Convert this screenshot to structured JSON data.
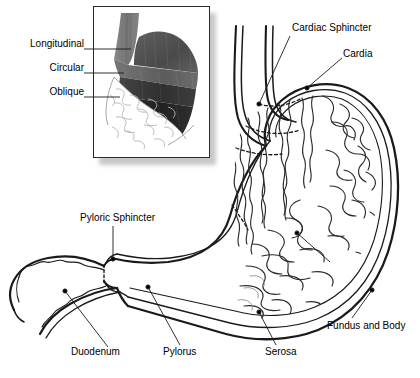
{
  "figure": {
    "width": 420,
    "height": 378,
    "background": "#ffffff",
    "line_color": "#1a1a1a",
    "text_color": "#000000"
  },
  "inset": {
    "name": "muscle-layers-inset",
    "description": "Grayscale photograph-style inset of the stomach showing three muscle layers and cut-away mucosa with rugae",
    "frame": {
      "x": 93,
      "y": 6,
      "width": 117,
      "height": 152
    },
    "colors": {
      "esophagus": "#7d7d7d",
      "longitudinal": "#6e6e6e",
      "circular": "#3c3c3c",
      "oblique": "#2a2a2a",
      "fundus_top": "#545454",
      "mucosa": "#ffffff",
      "rugae": "#b9b9b9",
      "shadow": "#9a9a9a"
    },
    "labels": [
      {
        "id": "longitudinal",
        "text": "Longitudinal",
        "x": 18,
        "y": 44,
        "leader_x1": 84,
        "leader_y1": 49,
        "leader_x2": 131,
        "leader_y2": 49
      },
      {
        "id": "circular",
        "text": "Circular",
        "x": 40,
        "y": 68,
        "leader_x1": 84,
        "leader_y1": 73,
        "leader_x2": 124,
        "leader_y2": 73
      },
      {
        "id": "oblique",
        "text": "Oblique",
        "x": 40,
        "y": 92,
        "leader_x1": 84,
        "leader_y1": 97,
        "leader_x2": 120,
        "leader_y2": 97
      }
    ]
  },
  "main_diagram": {
    "name": "stomach-cutaway",
    "description": "Line-art cut-away of stomach, esophagus and duodenum showing rugae of the mucosa",
    "labels": [
      {
        "id": "cardiac-sphincter",
        "text": "Cardiac Sphincter",
        "x": 292,
        "y": 24,
        "align": "left",
        "leader": [
          [
            290,
            36
          ],
          [
            259,
            104
          ]
        ],
        "dot": [
          259,
          104
        ]
      },
      {
        "id": "cardia",
        "text": "Cardia",
        "x": 343,
        "y": 50,
        "align": "left",
        "leader": [
          [
            342,
            58
          ],
          [
            307,
            88
          ]
        ],
        "dot": [
          307,
          88
        ]
      },
      {
        "id": "pyloric-sphincter",
        "text": "Pyloric Sphincter",
        "x": 80,
        "y": 214,
        "align": "left",
        "leader": [
          [
            113,
            226
          ],
          [
            113,
            259
          ]
        ],
        "dot": [
          113,
          259
        ]
      },
      {
        "id": "duodenum",
        "text": "Duodenum",
        "x": 71,
        "y": 349,
        "align": "left",
        "leader": [
          [
            108,
            347
          ],
          [
            65,
            291
          ]
        ],
        "dot": [
          65,
          291
        ]
      },
      {
        "id": "pylorus",
        "text": "Pylorus",
        "x": 163,
        "y": 349,
        "align": "left",
        "leader": [
          [
            180,
            345
          ],
          [
            148,
            287
          ]
        ],
        "dot": [
          148,
          287
        ]
      },
      {
        "id": "serosa",
        "text": "Serosa",
        "x": 265,
        "y": 349,
        "align": "left",
        "leader": [
          [
            276,
            345
          ],
          [
            259,
            312
          ]
        ],
        "dot": [
          259,
          312
        ]
      },
      {
        "id": "fundus-and-body",
        "text": "Fundus and Body",
        "x": 327,
        "y": 322,
        "align": "left",
        "leader": [
          [
            352,
            318
          ],
          [
            372,
            290
          ]
        ],
        "dot": [
          372,
          290
        ]
      },
      {
        "id": "rugae-pointer",
        "text": "",
        "x": 0,
        "y": 0,
        "align": "left",
        "leader": [
          [
            330,
            262
          ],
          [
            297,
            233
          ]
        ],
        "dot": [
          297,
          233
        ]
      }
    ]
  }
}
